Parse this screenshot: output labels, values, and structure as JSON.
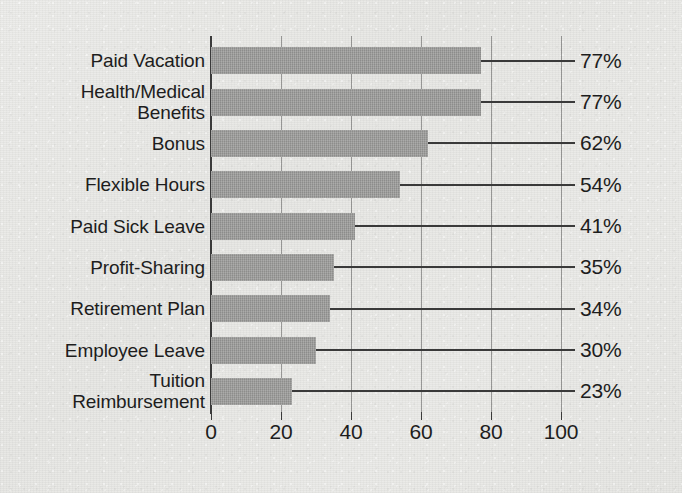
{
  "chart_data": {
    "type": "bar",
    "orientation": "horizontal",
    "title": "",
    "subtitle": "",
    "xlabel": "",
    "ylabel": "",
    "xlim": [
      0,
      100
    ],
    "grid": true,
    "legend": false,
    "categories": [
      "Paid Vacation",
      "Health/Medical\nBenefits",
      "Bonus",
      "Flexible Hours",
      "Paid Sick Leave",
      "Profit-Sharing",
      "Retirement Plan",
      "Employee Leave",
      "Tuition\nReimbursement"
    ],
    "values": [
      77,
      77,
      62,
      54,
      41,
      35,
      34,
      30,
      23
    ],
    "value_labels": [
      "77%",
      "77%",
      "62%",
      "54%",
      "41%",
      "35%",
      "34%",
      "30%",
      "23%"
    ],
    "xticks": [
      0,
      20,
      40,
      60,
      80,
      100
    ],
    "xtick_labels": [
      "0",
      "20",
      "40",
      "60",
      "80",
      "100"
    ],
    "colors": {
      "background": "#e9e9e7",
      "bar_fill": "#9b9b99",
      "axis": "#3a3a3a",
      "gridline": "#6a6a6a",
      "text": "#1d1d1d",
      "leader_line": "#3a3a3a"
    }
  }
}
